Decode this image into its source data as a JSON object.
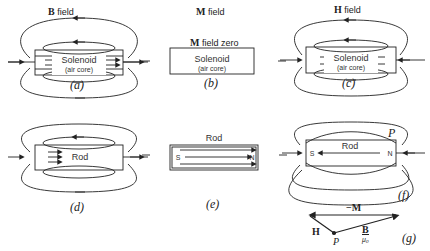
{
  "headers": {
    "b_field": {
      "symbol": "B",
      "text": "field"
    },
    "m_field": {
      "symbol": "M",
      "text": "field"
    },
    "h_field": {
      "symbol": "H",
      "text": "field"
    }
  },
  "panels": {
    "a": {
      "caption": "(a)",
      "box_label": "Solenoid",
      "box_sublabel": "(air core)"
    },
    "b": {
      "caption": "(b)",
      "note_symbol": "M",
      "note_text": "field zero",
      "box_label": "Solenoid",
      "box_sublabel": "(air core)"
    },
    "c": {
      "caption": "(c)",
      "box_label": "Solenoid",
      "box_sublabel": "(air core)"
    },
    "d": {
      "caption": "(d)",
      "box_label": "Rod"
    },
    "e": {
      "caption": "(e)",
      "box_label": "Rod",
      "pole_s": "S",
      "pole_n": "N"
    },
    "f": {
      "caption": "(f)",
      "box_label": "Rod",
      "pole_s": "S",
      "pole_n": "N",
      "point": "P"
    },
    "g": {
      "caption": "(g)",
      "vec_m": "−M",
      "vec_h": "H",
      "vec_b_num": "B",
      "vec_b_den": "μ₀",
      "point": "P"
    }
  }
}
